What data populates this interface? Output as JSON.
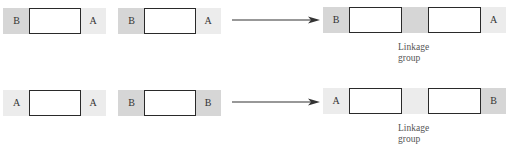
{
  "figure": {
    "rows": [
      {
        "chromosome_1": {
          "left_label": "B",
          "right_label": "A"
        },
        "chromosome_2": {
          "left_label": "B",
          "right_label": "A"
        },
        "result": {
          "left_label": "B",
          "right_label": "A",
          "caption_line1": "Linkage",
          "caption_line2": "group"
        }
      },
      {
        "chromosome_1": {
          "left_label": "A",
          "right_label": "A"
        },
        "chromosome_2": {
          "left_label": "B",
          "right_label": "B"
        },
        "result": {
          "left_label": "A",
          "right_label": "B",
          "caption_line1": "Linkage",
          "caption_line2": "group"
        }
      }
    ],
    "colors": {
      "segment_b": "#d6d6d6",
      "segment_a": "#ececec",
      "box_border": "#2a2a2a",
      "arrow": "#333333"
    }
  }
}
